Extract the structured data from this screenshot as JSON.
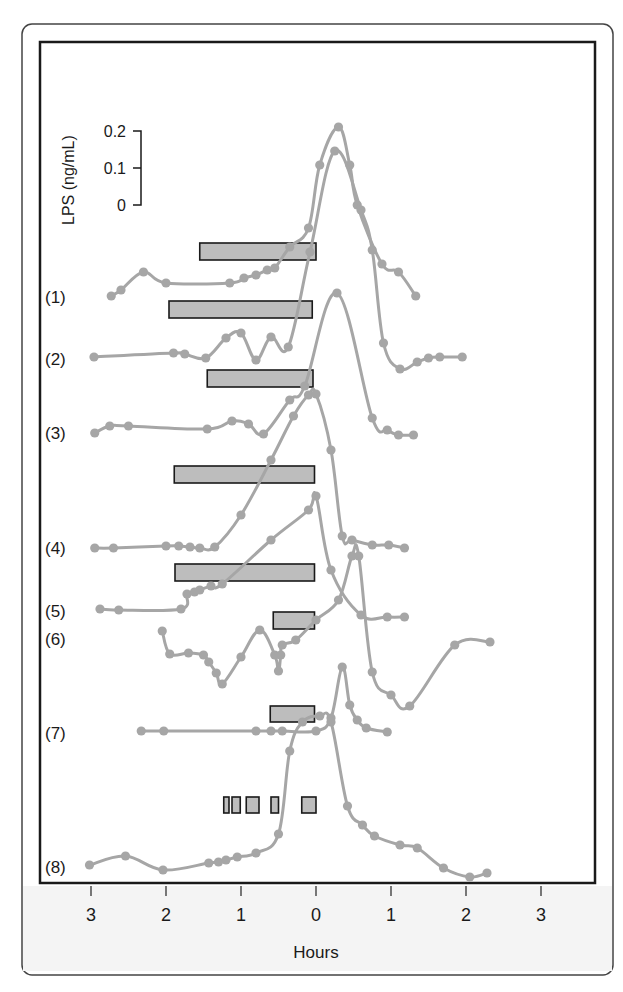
{
  "chart_data": {
    "type": "line",
    "title": "",
    "xlabel": "Hours",
    "ylabel": "LPS (ng/mL)",
    "x_ticks": [
      {
        "value": -3,
        "label": "3"
      },
      {
        "value": -2,
        "label": "2"
      },
      {
        "value": -1,
        "label": "1"
      },
      {
        "value": 0,
        "label": "0"
      },
      {
        "value": 1,
        "label": "1"
      },
      {
        "value": 2,
        "label": "2"
      },
      {
        "value": 3,
        "label": "3"
      }
    ],
    "xlim": [
      -3.3,
      3.7
    ],
    "grid": false,
    "scale_bar": {
      "label": "LPS (ng/mL)",
      "ticks": [
        {
          "value": 0.2,
          "label": "0.2"
        },
        {
          "value": 0.1,
          "label": "0.1"
        },
        {
          "value": 0,
          "label": "0"
        }
      ],
      "px_per_0_1": 37
    },
    "series": [
      {
        "name": "(1)",
        "baseline_px": 297,
        "points": [
          [
            -2.73,
            296
          ],
          [
            -2.6,
            290
          ],
          [
            -2.3,
            272
          ],
          [
            -2.0,
            283
          ],
          [
            -1.15,
            283
          ],
          [
            -0.96,
            278
          ],
          [
            -0.8,
            275
          ],
          [
            -0.65,
            270
          ],
          [
            -0.55,
            268
          ],
          [
            -0.35,
            247
          ],
          [
            -0.1,
            228
          ],
          [
            0.05,
            165
          ],
          [
            0.3,
            127
          ],
          [
            0.45,
            165
          ],
          [
            0.55,
            205
          ],
          [
            0.88,
            264
          ],
          [
            1.1,
            272
          ],
          [
            1.33,
            296
          ]
        ],
        "peak_lps": 0.21
      },
      {
        "name": "(2)",
        "baseline_px": 357,
        "points": [
          [
            -2.96,
            357
          ],
          [
            -1.9,
            353
          ],
          [
            -1.75,
            354
          ],
          [
            -1.47,
            358
          ],
          [
            -1.2,
            338
          ],
          [
            -1.0,
            333
          ],
          [
            -0.8,
            360
          ],
          [
            -0.6,
            337
          ],
          [
            -0.37,
            347
          ],
          [
            -0.08,
            252
          ],
          [
            0.25,
            151
          ],
          [
            0.6,
            210
          ],
          [
            0.75,
            250
          ],
          [
            0.9,
            343
          ],
          [
            1.12,
            369
          ],
          [
            1.35,
            362
          ],
          [
            1.5,
            358
          ],
          [
            1.65,
            357
          ],
          [
            1.95,
            357
          ]
        ],
        "peak_lps": 0.15
      },
      {
        "name": "(3)",
        "baseline_px": 433,
        "points": [
          [
            -2.95,
            433
          ],
          [
            -2.75,
            426
          ],
          [
            -2.5,
            426
          ],
          [
            -1.45,
            429
          ],
          [
            -1.12,
            421
          ],
          [
            -0.9,
            424
          ],
          [
            -0.7,
            434
          ],
          [
            -0.35,
            400
          ],
          [
            -0.15,
            386
          ],
          [
            0.28,
            293
          ],
          [
            0.75,
            418
          ],
          [
            0.95,
            430
          ],
          [
            1.1,
            435
          ],
          [
            1.3,
            435
          ]
        ],
        "peak_lps": 0.16
      },
      {
        "name": "(4)",
        "baseline_px": 547,
        "points": [
          [
            -2.95,
            548
          ],
          [
            -2.7,
            548
          ],
          [
            -2.0,
            546
          ],
          [
            -1.83,
            546
          ],
          [
            -1.68,
            547
          ],
          [
            -1.55,
            548
          ],
          [
            -1.35,
            547
          ],
          [
            -1.0,
            515
          ],
          [
            -0.6,
            460
          ],
          [
            -0.3,
            416
          ],
          [
            -0.1,
            395
          ],
          [
            0.0,
            394
          ],
          [
            0.2,
            450
          ],
          [
            0.35,
            536
          ],
          [
            0.48,
            540
          ],
          [
            0.75,
            545
          ],
          [
            0.97,
            545
          ],
          [
            1.18,
            548
          ]
        ],
        "peak_lps": 0.14
      },
      {
        "name": "(5)",
        "baseline_px": 609,
        "points": [
          [
            -2.88,
            609
          ],
          [
            -2.63,
            610
          ],
          [
            -1.8,
            609
          ],
          [
            -1.72,
            594
          ],
          [
            -1.62,
            592
          ],
          [
            -1.55,
            590
          ],
          [
            -1.4,
            586
          ],
          [
            -1.25,
            584
          ],
          [
            -0.6,
            540
          ],
          [
            -0.1,
            510
          ],
          [
            0.0,
            496
          ],
          [
            0.2,
            570
          ],
          [
            0.6,
            615
          ],
          [
            0.95,
            617
          ],
          [
            1.18,
            617
          ]
        ],
        "peak_lps": 0.31
      },
      {
        "name": "(6)",
        "baseline_px": 630,
        "points": [
          [
            -2.05,
            631
          ],
          [
            -1.95,
            654
          ],
          [
            -1.7,
            653
          ],
          [
            -1.5,
            655
          ],
          [
            -1.43,
            662
          ],
          [
            -1.33,
            673
          ],
          [
            -1.25,
            684
          ],
          [
            -1.0,
            657
          ],
          [
            -0.75,
            630
          ],
          [
            -0.55,
            655
          ],
          [
            -0.5,
            671
          ],
          [
            -0.47,
            655
          ],
          [
            -0.45,
            645
          ],
          [
            -0.27,
            640
          ],
          [
            0.0,
            620
          ],
          [
            0.3,
            600
          ],
          [
            0.48,
            556
          ],
          [
            0.57,
            556
          ],
          [
            0.75,
            672
          ],
          [
            1.0,
            695
          ],
          [
            1.25,
            706
          ],
          [
            1.85,
            645
          ],
          [
            2.32,
            642
          ]
        ],
        "peak_lps": 0.2
      },
      {
        "name": "(7)",
        "baseline_px": 731,
        "points": [
          [
            -2.33,
            731
          ],
          [
            -2.03,
            731
          ],
          [
            -0.8,
            731
          ],
          [
            -0.6,
            731
          ],
          [
            -0.45,
            731
          ],
          [
            0.0,
            731
          ],
          [
            0.2,
            718
          ],
          [
            0.35,
            667
          ],
          [
            0.45,
            705
          ],
          [
            0.55,
            720
          ],
          [
            0.67,
            728
          ],
          [
            0.95,
            732
          ]
        ],
        "peak_lps": 0.17
      },
      {
        "name": "(8)",
        "baseline_px": 865,
        "points": [
          [
            -3.02,
            865
          ],
          [
            -2.54,
            856
          ],
          [
            -2.04,
            870
          ],
          [
            -1.43,
            863
          ],
          [
            -1.3,
            862
          ],
          [
            -1.2,
            860
          ],
          [
            -1.05,
            857
          ],
          [
            -0.8,
            853
          ],
          [
            -0.5,
            834
          ],
          [
            -0.35,
            751
          ],
          [
            -0.18,
            722
          ],
          [
            0.05,
            716
          ],
          [
            0.2,
            722
          ],
          [
            0.42,
            806
          ],
          [
            0.62,
            825
          ],
          [
            0.78,
            836
          ],
          [
            1.12,
            845
          ],
          [
            1.35,
            848
          ],
          [
            1.7,
            868
          ],
          [
            2.05,
            877
          ],
          [
            2.28,
            873
          ]
        ],
        "peak_lps": 0.4
      }
    ],
    "bars": [
      {
        "row": "(1)",
        "start_h": -1.55,
        "end_h": 0.0,
        "y_px": 243,
        "h_px": 17
      },
      {
        "row": "(2)",
        "start_h": -1.96,
        "end_h": -0.05,
        "y_px": 301,
        "h_px": 17
      },
      {
        "row": "(3)",
        "start_h": -1.45,
        "end_h": -0.04,
        "y_px": 370,
        "h_px": 17
      },
      {
        "row": "(4)",
        "start_h": -1.89,
        "end_h": -0.02,
        "y_px": 466,
        "h_px": 17
      },
      {
        "row": "(5)",
        "start_h": -1.88,
        "end_h": -0.02,
        "y_px": 564,
        "h_px": 17
      },
      {
        "row": "(6)",
        "start_h": -0.57,
        "end_h": -0.02,
        "y_px": 612,
        "h_px": 17
      },
      {
        "row": "(7)",
        "start_h": -0.61,
        "end_h": -0.02,
        "y_px": 706,
        "h_px": 16
      },
      {
        "row": "(8)",
        "start_h": -1.23,
        "end_h": -1.16,
        "y_px": 797,
        "h_px": 16
      },
      {
        "row": "(8)",
        "start_h": -1.12,
        "end_h": -1.01,
        "y_px": 797,
        "h_px": 16
      },
      {
        "row": "(8)",
        "start_h": -0.93,
        "end_h": -0.76,
        "y_px": 797,
        "h_px": 16
      },
      {
        "row": "(8)",
        "start_h": -0.6,
        "end_h": -0.5,
        "y_px": 797,
        "h_px": 16
      },
      {
        "row": "(8)",
        "start_h": -0.19,
        "end_h": 0.0,
        "y_px": 797,
        "h_px": 16
      }
    ],
    "row_labels": [
      {
        "label": "(1)",
        "y_px": 297
      },
      {
        "label": "(2)",
        "y_px": 359
      },
      {
        "label": "(3)",
        "y_px": 433
      },
      {
        "label": "(4)",
        "y_px": 548
      },
      {
        "label": "(5)",
        "y_px": 611
      },
      {
        "label": "(6)",
        "y_px": 639
      },
      {
        "label": "(7)",
        "y_px": 733
      },
      {
        "label": "(8)",
        "y_px": 867
      }
    ]
  },
  "layout": {
    "zero_x_px": 316,
    "px_per_hour": 75,
    "plot_frame": {
      "x": 40,
      "y": 42,
      "w": 555,
      "h": 841
    },
    "outer_box": {
      "x": 22,
      "y": 24,
      "w": 591,
      "h": 951,
      "r": 10
    },
    "colors": {
      "curve": "#a6a6a6",
      "bar_fill": "#bdbdbd",
      "frame": "#1a1a1a"
    }
  }
}
